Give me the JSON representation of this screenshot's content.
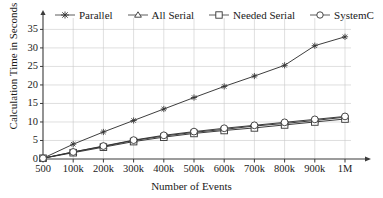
{
  "chart_data": {
    "type": "line",
    "title": "",
    "xlabel": "Number of Events",
    "ylabel": "Calculation Time in Seconds",
    "categories": [
      "500",
      "100k",
      "200k",
      "300k",
      "400k",
      "500k",
      "600k",
      "700k",
      "800k",
      "900k",
      "1M"
    ],
    "x_tick_labels": [
      "500",
      "100k",
      "200k",
      "300k",
      "400k",
      "500k",
      "600k",
      "700k",
      "800k",
      "900k",
      "1M"
    ],
    "y_tick_labels": [
      "0",
      "5",
      "10",
      "15",
      "20",
      "25",
      "30",
      "35"
    ],
    "y_ticks": [
      0,
      5,
      10,
      15,
      20,
      25,
      30,
      35
    ],
    "ylim": [
      0,
      37
    ],
    "grid": true,
    "legend_position": "top",
    "series": [
      {
        "name": "Parallel",
        "marker": "star",
        "values": [
          0.2,
          4.0,
          7.3,
          10.4,
          13.5,
          16.6,
          19.6,
          22.4,
          25.3,
          30.6,
          33.0
        ]
      },
      {
        "name": "All Serial",
        "marker": "triangle",
        "values": [
          0.2,
          1.9,
          3.4,
          5.0,
          6.2,
          7.2,
          8.0,
          8.9,
          9.6,
          10.4,
          11.3
        ]
      },
      {
        "name": "Needed Serial",
        "marker": "square",
        "values": [
          0.2,
          1.7,
          3.2,
          4.7,
          5.9,
          6.9,
          7.7,
          8.4,
          9.2,
          10.0,
          10.8
        ]
      },
      {
        "name": "SystemC",
        "marker": "circle",
        "values": [
          0.2,
          1.9,
          3.5,
          5.1,
          6.4,
          7.4,
          8.3,
          9.1,
          9.9,
          10.7,
          11.5
        ]
      }
    ]
  },
  "legend": {
    "items": [
      {
        "label": "Parallel",
        "marker": "star"
      },
      {
        "label": "All Serial",
        "marker": "triangle"
      },
      {
        "label": "Needed Serial",
        "marker": "square"
      },
      {
        "label": "SystemC",
        "marker": "circle"
      }
    ]
  },
  "axes": {
    "y_title": "Calculation Time in Seconds",
    "x_title": "Number of Events"
  }
}
